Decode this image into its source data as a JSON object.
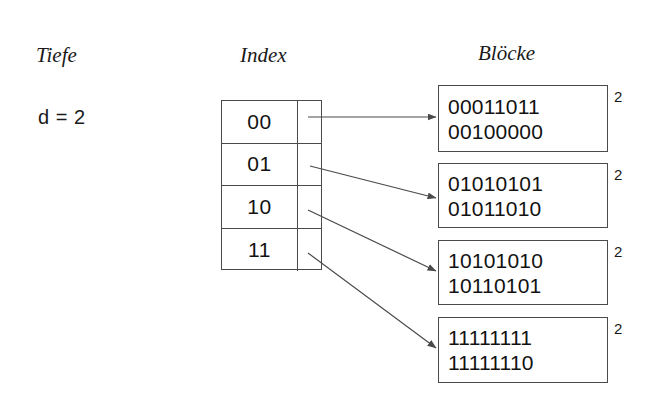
{
  "diagram": {
    "background_color": "#ffffff",
    "line_color": "#4a4a4a",
    "text_color": "#121212"
  },
  "headings": {
    "depth": "Tiefe",
    "index": "Index",
    "blocks": "Blöcke"
  },
  "depth": {
    "label": "d = 2"
  },
  "index_table": {
    "rows": [
      {
        "key": "00"
      },
      {
        "key": "01"
      },
      {
        "key": "10"
      },
      {
        "key": "11"
      }
    ]
  },
  "blocks": [
    {
      "lines": [
        "00011011",
        "00100000"
      ],
      "local_depth": "2"
    },
    {
      "lines": [
        "01010101",
        "01011010"
      ],
      "local_depth": "2"
    },
    {
      "lines": [
        "10101010",
        "10110101"
      ],
      "local_depth": "2"
    },
    {
      "lines": [
        "11111111",
        "11111110"
      ],
      "local_depth": "2"
    }
  ],
  "pointers": [
    {
      "name": "pointer-00-to-block-0",
      "from_row": "00",
      "to_block": 0
    },
    {
      "name": "pointer-01-to-block-1",
      "from_row": "01",
      "to_block": 1
    },
    {
      "name": "pointer-10-to-block-2",
      "from_row": "10",
      "to_block": 2
    },
    {
      "name": "pointer-11-to-block-3",
      "from_row": "11",
      "to_block": 3
    }
  ]
}
